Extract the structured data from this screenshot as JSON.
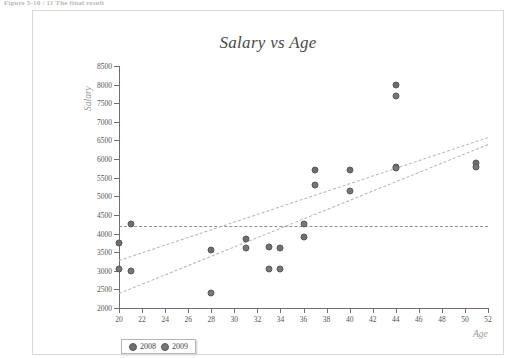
{
  "caption": "Figure 5-10 / 11  The final result",
  "chart_data": {
    "type": "scatter",
    "title": "Salary vs Age",
    "xlabel": "Age",
    "ylabel": "Salary",
    "xlim": [
      20,
      52
    ],
    "ylim": [
      2000,
      8500
    ],
    "xticks": [
      20,
      22,
      24,
      26,
      28,
      30,
      32,
      34,
      36,
      38,
      40,
      42,
      44,
      46,
      48,
      50,
      52
    ],
    "yticks": [
      2000,
      2500,
      3000,
      3500,
      4000,
      4500,
      5000,
      5500,
      6000,
      6500,
      7000,
      7500,
      8000,
      8500
    ],
    "grid": false,
    "legend_position": "bottom-left",
    "series": [
      {
        "name": "2008",
        "color": "#6e6e6e",
        "points": [
          {
            "x": 20,
            "y": 3750
          },
          {
            "x": 21,
            "y": 4250
          },
          {
            "x": 28,
            "y": 3550
          },
          {
            "x": 31,
            "y": 3850
          },
          {
            "x": 33,
            "y": 3650
          },
          {
            "x": 34,
            "y": 3600
          },
          {
            "x": 36,
            "y": 3900
          },
          {
            "x": 37,
            "y": 5700
          },
          {
            "x": 40,
            "y": 5700
          },
          {
            "x": 44,
            "y": 8000
          },
          {
            "x": 44,
            "y": 5800
          },
          {
            "x": 51,
            "y": 5900
          }
        ]
      },
      {
        "name": "2009",
        "color": "#767676",
        "points": [
          {
            "x": 20,
            "y": 3050
          },
          {
            "x": 21,
            "y": 3000
          },
          {
            "x": 28,
            "y": 2400
          },
          {
            "x": 31,
            "y": 3600
          },
          {
            "x": 33,
            "y": 3050
          },
          {
            "x": 34,
            "y": 3050
          },
          {
            "x": 36,
            "y": 4250
          },
          {
            "x": 37,
            "y": 5300
          },
          {
            "x": 40,
            "y": 5150
          },
          {
            "x": 44,
            "y": 7700
          },
          {
            "x": 44,
            "y": 5750
          },
          {
            "x": 51,
            "y": 5800
          }
        ]
      }
    ],
    "trendlines": [
      {
        "name": "flat-reference",
        "style": "dashed",
        "x0": 20,
        "y0": 4200,
        "x1": 52,
        "y1": 4200
      },
      {
        "name": "upper-trend",
        "style": "dashed",
        "x0": 20,
        "y0": 3300,
        "x1": 52,
        "y1": 6600
      },
      {
        "name": "lower-trend",
        "style": "dashed",
        "x0": 20,
        "y0": 2400,
        "x1": 52,
        "y1": 6400
      }
    ]
  },
  "legend": {
    "items": [
      {
        "label": "2008"
      },
      {
        "label": "2009"
      }
    ]
  }
}
